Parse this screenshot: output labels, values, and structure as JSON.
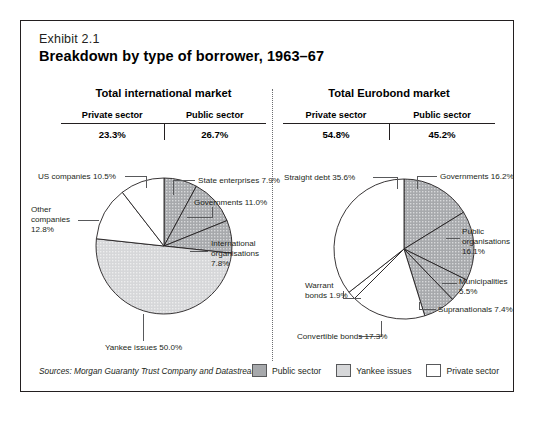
{
  "exhibit": {
    "number": "Exhibit 2.1",
    "title": "Breakdown by type of borrower, 1963–67",
    "source": "Sources: Morgan Guaranty Trust Company and Datastream."
  },
  "legend": [
    {
      "label": "Public sector",
      "key": "public",
      "color": "#a7a9ac"
    },
    {
      "label": "Yankee issues",
      "key": "yankee",
      "color": "#d6d7d9"
    },
    {
      "label": "Private sector",
      "key": "private",
      "color": "#ffffff"
    }
  ],
  "colors": {
    "public": "#a7a9ac",
    "yankee": "#d6d7d9",
    "private": "#ffffff",
    "stroke": "#231f20",
    "leader": "#58595b"
  },
  "panels": [
    {
      "id": "international",
      "title": "Total international market",
      "private_label": "Private sector",
      "public_label": "Public sector",
      "private_pct": "23.3%",
      "public_pct": "26.7%"
    },
    {
      "id": "eurobond",
      "title": "Total Eurobond market",
      "private_label": "Private sector",
      "public_label": "Public sector",
      "private_pct": "54.8%",
      "public_pct": "45.2%"
    }
  ],
  "chart_data": [
    {
      "type": "pie",
      "id": "international",
      "title": "Total international market",
      "start_angle_deg": -90,
      "direction": "clockwise",
      "labels": [
        "State enterprises 7.9%",
        "Governments 11.0%",
        "International organisations 7.8%",
        "Yankee issues 50.0%",
        "Other companies 12.8%",
        "US companies 10.5%"
      ],
      "slices": [
        {
          "name": "State enterprises",
          "value": 7.9,
          "label": "State enterprises 7.9%",
          "group": "public"
        },
        {
          "name": "Governments",
          "value": 11.0,
          "label": "Governments 11.0%",
          "group": "public"
        },
        {
          "name": "International organisations",
          "value": 7.8,
          "label": "International organisations 7.8%",
          "group": "public"
        },
        {
          "name": "Yankee issues",
          "value": 50.0,
          "label": "Yankee issues 50.0%",
          "group": "yankee"
        },
        {
          "name": "Other companies",
          "value": 12.8,
          "label": "Other companies 12.8%",
          "group": "private"
        },
        {
          "name": "US companies",
          "value": 10.5,
          "label": "US companies 10.5%",
          "group": "private"
        }
      ]
    },
    {
      "type": "pie",
      "id": "eurobond",
      "title": "Total Eurobond market",
      "start_angle_deg": -90,
      "direction": "clockwise",
      "labels": [
        "Governments 16.2%",
        "Public organisations 16.1%",
        "Municipalities 5.5%",
        "Supranationals 7.4%",
        "Convertible bonds 17.3%",
        "Warrant bonds 1.9%",
        "Straight debt 35.6%"
      ],
      "slices": [
        {
          "name": "Governments",
          "value": 16.2,
          "label": "Governments 16.2%",
          "group": "public"
        },
        {
          "name": "Public organisations",
          "value": 16.1,
          "label": "Public organisations 16.1%",
          "group": "public"
        },
        {
          "name": "Municipalities",
          "value": 5.5,
          "label": "Municipalities 5.5%",
          "group": "public"
        },
        {
          "name": "Supranationals",
          "value": 7.4,
          "label": "Supranationals 7.4%",
          "group": "public"
        },
        {
          "name": "Convertible bonds",
          "value": 17.3,
          "label": "Convertible bonds 17.3%",
          "group": "private"
        },
        {
          "name": "Warrant bonds",
          "value": 1.9,
          "label": "Warrant bonds 1.9%",
          "group": "private"
        },
        {
          "name": "Straight debt",
          "value": 35.6,
          "label": "Straight debt 35.6%",
          "group": "private"
        }
      ]
    }
  ],
  "annotations": {
    "intl": {
      "state_enterprises": "State enterprises 7.9%",
      "governments": "Governments 11.0%",
      "intl_orgs_1": "International",
      "intl_orgs_2": "organisations",
      "intl_orgs_3": "7.8%",
      "yankee": "Yankee issues 50.0%",
      "other_1": "Other",
      "other_2": "companies",
      "other_3": "12.8%",
      "us": "US companies 10.5%"
    },
    "euro": {
      "straight": "Straight debt 35.6%",
      "governments": "Governments 16.2%",
      "pub_org_1": "Public",
      "pub_org_2": "organisations",
      "pub_org_3": "16.1%",
      "municipalities_1": "Municipalities",
      "municipalities_2": "5.5%",
      "supranationals": "Supranationals 7.4%",
      "convertible": "Convertible bonds 17.3%",
      "warrant_1": "Warrant",
      "warrant_2": "bonds 1.9%"
    }
  }
}
